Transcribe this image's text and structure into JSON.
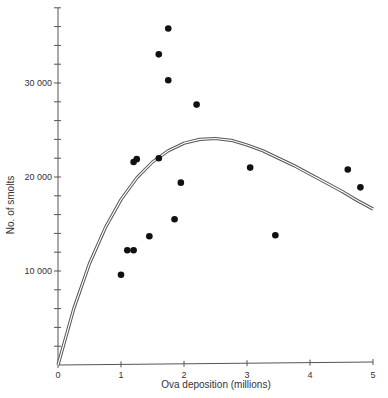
{
  "chart_data": {
    "type": "scatter",
    "title": "",
    "xlabel": "Ova deposition (millions)",
    "ylabel": "No. of smolts",
    "xlim": [
      0,
      5
    ],
    "ylim": [
      0,
      38000
    ],
    "x_ticks": [
      0,
      1,
      2,
      3,
      4,
      5
    ],
    "x_tick_labels": [
      "0",
      "1",
      "2",
      "3",
      "4",
      "5"
    ],
    "y_ticks": [
      10000,
      20000,
      30000
    ],
    "y_tick_labels": [
      "10 000",
      "20 000",
      "30 000"
    ],
    "y_minor_tick_step": 2000,
    "grid": false,
    "legend": null,
    "series": [
      {
        "name": "Observed",
        "kind": "scatter",
        "color": "#111111",
        "points": [
          {
            "x": 1.0,
            "y": 9600
          },
          {
            "x": 1.1,
            "y": 12200
          },
          {
            "x": 1.2,
            "y": 12200
          },
          {
            "x": 1.2,
            "y": 21600
          },
          {
            "x": 1.25,
            "y": 21900
          },
          {
            "x": 1.45,
            "y": 13700
          },
          {
            "x": 1.6,
            "y": 22000
          },
          {
            "x": 1.6,
            "y": 33050
          },
          {
            "x": 1.75,
            "y": 35800
          },
          {
            "x": 1.75,
            "y": 30300
          },
          {
            "x": 1.85,
            "y": 15500
          },
          {
            "x": 1.95,
            "y": 19400
          },
          {
            "x": 2.2,
            "y": 27700
          },
          {
            "x": 3.05,
            "y": 21000
          },
          {
            "x": 3.45,
            "y": 13800
          },
          {
            "x": 4.6,
            "y": 20800
          },
          {
            "x": 4.8,
            "y": 18900
          }
        ]
      },
      {
        "name": "Fitted stock-recruitment curve",
        "kind": "line",
        "style": "double",
        "color": "#555555",
        "points": [
          {
            "x": 0,
            "y": 0
          },
          {
            "x": 0.25,
            "y": 6000
          },
          {
            "x": 0.5,
            "y": 10800
          },
          {
            "x": 0.75,
            "y": 14600
          },
          {
            "x": 1.0,
            "y": 17600
          },
          {
            "x": 1.25,
            "y": 19900
          },
          {
            "x": 1.5,
            "y": 21600
          },
          {
            "x": 1.75,
            "y": 22800
          },
          {
            "x": 2.0,
            "y": 23600
          },
          {
            "x": 2.25,
            "y": 24000
          },
          {
            "x": 2.5,
            "y": 24100
          },
          {
            "x": 2.75,
            "y": 23900
          },
          {
            "x": 3.0,
            "y": 23400
          },
          {
            "x": 3.25,
            "y": 22800
          },
          {
            "x": 3.5,
            "y": 22000
          },
          {
            "x": 3.75,
            "y": 21200
          },
          {
            "x": 4.0,
            "y": 20300
          },
          {
            "x": 4.25,
            "y": 19400
          },
          {
            "x": 4.5,
            "y": 18500
          },
          {
            "x": 4.75,
            "y": 17500
          },
          {
            "x": 5.0,
            "y": 16600
          }
        ]
      }
    ]
  },
  "plot": {
    "origin_px": [
      58,
      365
    ],
    "px_per_x": 63,
    "px_per_10000_y": 94,
    "axis_color": "#555555"
  }
}
